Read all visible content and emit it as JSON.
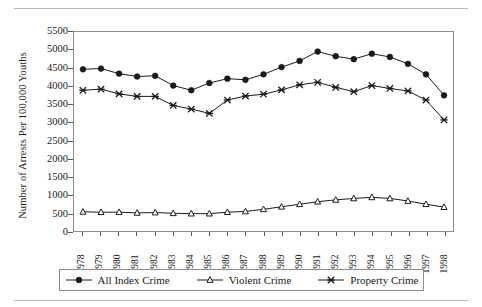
{
  "figure": {
    "top_rule": true,
    "bottom_rule": true
  },
  "chart_data": {
    "type": "line",
    "title": "",
    "xlabel": "",
    "ylabel": "Number of Arrests Per 100,000 Youths",
    "ylim": [
      0,
      5500
    ],
    "yticks": [
      0,
      500,
      1000,
      1500,
      2000,
      2500,
      3000,
      3500,
      4000,
      4500,
      5000,
      5500
    ],
    "ytick_labels": [
      "0",
      "500",
      "1000",
      "1500",
      "2000",
      "2500",
      "3000",
      "3500",
      "4000",
      "4500",
      "5000",
      "5500"
    ],
    "grid": false,
    "legend_position": "bottom",
    "categories": [
      "1978",
      "1979",
      "1980",
      "1981",
      "1982",
      "1983",
      "1984",
      "1985",
      "1986",
      "1987",
      "1988",
      "1989",
      "1990",
      "1991",
      "1992",
      "1993",
      "1994",
      "1995",
      "1996",
      "1997",
      "1998"
    ],
    "series": [
      {
        "name": "All Index Crime",
        "marker": "filled-circle",
        "values": [
          4470,
          4490,
          4350,
          4270,
          4290,
          4020,
          3890,
          4090,
          4210,
          4180,
          4330,
          4530,
          4700,
          4960,
          4830,
          4750,
          4900,
          4810,
          4620,
          4330,
          3750
        ]
      },
      {
        "name": "Violent Crime",
        "marker": "open-triangle",
        "values": [
          530,
          520,
          520,
          500,
          510,
          490,
          480,
          480,
          520,
          540,
          600,
          670,
          740,
          810,
          860,
          900,
          930,
          900,
          830,
          740,
          660
        ]
      },
      {
        "name": "Property Crime",
        "marker": "cross-x",
        "values": [
          3890,
          3920,
          3790,
          3720,
          3720,
          3470,
          3370,
          3250,
          3620,
          3730,
          3780,
          3900,
          4040,
          4110,
          3970,
          3850,
          4020,
          3940,
          3870,
          3620,
          3070
        ]
      }
    ]
  },
  "legend": {
    "items": [
      {
        "label": "All Index Crime",
        "marker": "filled-circle"
      },
      {
        "label": "Violent Crime",
        "marker": "open-triangle"
      },
      {
        "label": "Property Crime",
        "marker": "cross-x"
      }
    ]
  },
  "colors": {
    "line": "#1a1a1a",
    "axis": "#8c8c8c",
    "rule": "#b9b9b9",
    "text": "#1a1a1a"
  }
}
